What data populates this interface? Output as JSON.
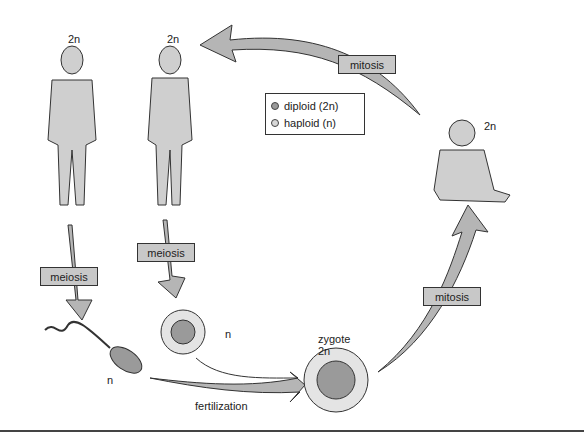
{
  "diagram": {
    "nodes": {
      "male": {
        "ploidy": "2n"
      },
      "female": {
        "ploidy": "2n"
      },
      "baby": {
        "ploidy": "2n"
      },
      "sperm": {
        "ploidy": "n"
      },
      "egg": {
        "ploidy": "n"
      },
      "zygote": {
        "label": "zygote",
        "ploidy": "2n"
      }
    },
    "processes": {
      "mitosis_top": "mitosis",
      "mitosis_right": "mitosis",
      "meiosis_male": "meiosis",
      "meiosis_female": "meiosis",
      "fertilization": "fertilization"
    },
    "legend": [
      {
        "label": "diploid (2n)",
        "color": "#9a9a9a"
      },
      {
        "label": "haploid (n)",
        "color": "#d8d8d8"
      }
    ]
  }
}
